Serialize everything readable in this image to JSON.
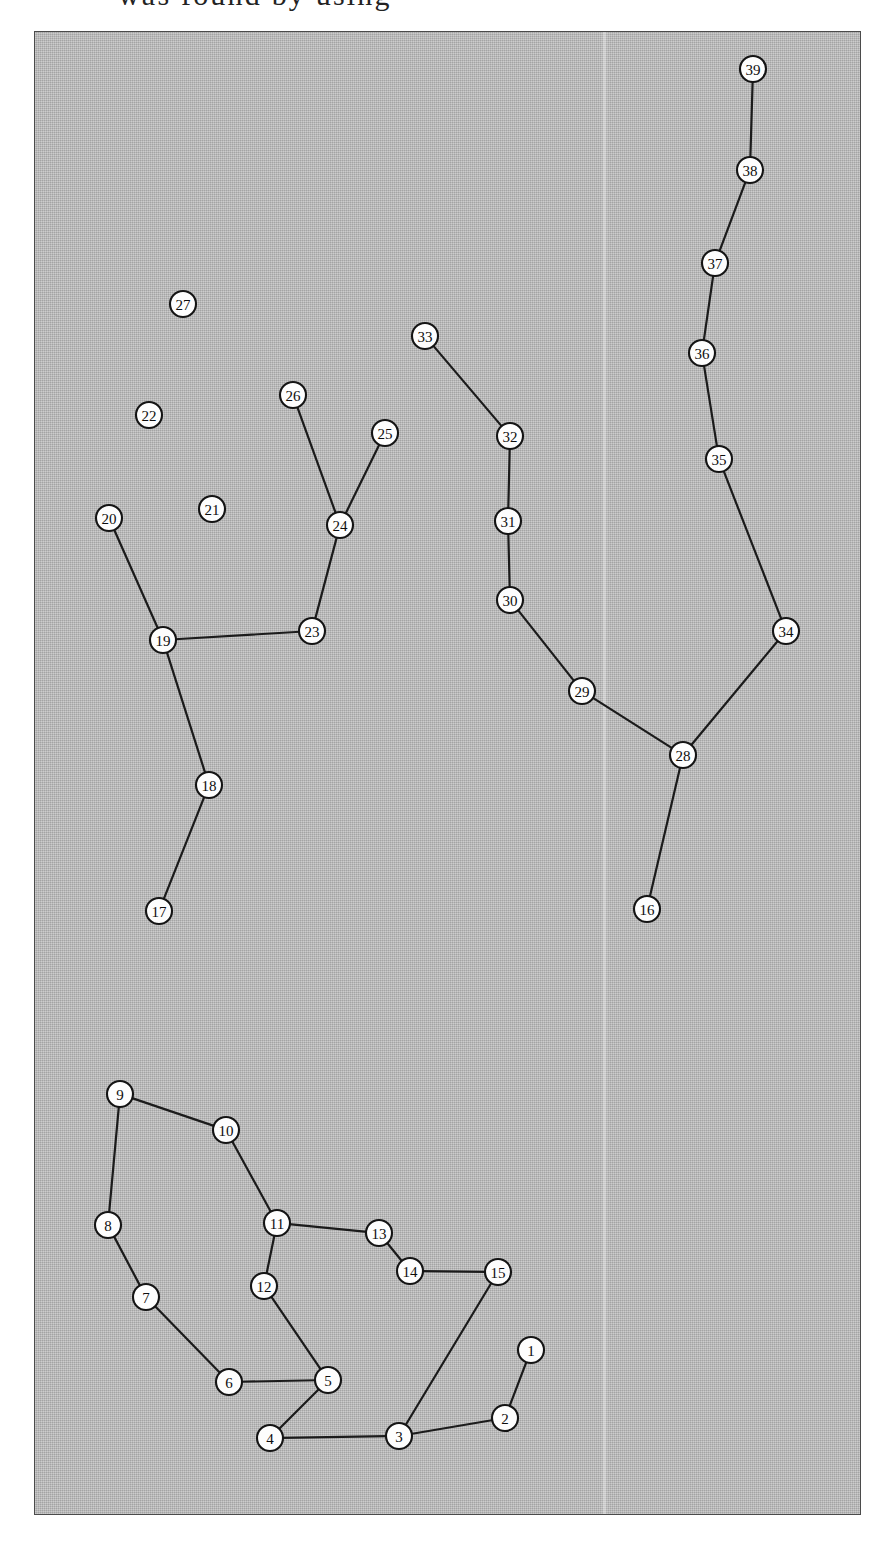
{
  "page": {
    "background_color": "#ffffff",
    "clipped_caption": "was found by using"
  },
  "figure": {
    "frame": {
      "x": 34,
      "y": 31,
      "width": 827,
      "height": 1484
    },
    "background_color": "#b6b6b6",
    "border_color": "#4b4b4b",
    "node_fill": "#fdfdfd",
    "node_stroke": "#141414",
    "edge_color": "#1b1b1b",
    "node_radius": 13
  },
  "chart_data": {
    "type": "diagram",
    "title": "",
    "subtitle": "",
    "xlabel": "",
    "ylabel": "",
    "graph_kind": "undirected node-link graph (forest with isolated vertices)",
    "node_count": 39,
    "edge_count": 35,
    "isolated_nodes": [
      "21",
      "22",
      "27"
    ],
    "nodes": [
      {
        "id": "1",
        "label": "1",
        "x": 496,
        "y": 1318
      },
      {
        "id": "2",
        "label": "2",
        "x": 470,
        "y": 1386
      },
      {
        "id": "3",
        "label": "3",
        "x": 364,
        "y": 1404
      },
      {
        "id": "4",
        "label": "4",
        "x": 235,
        "y": 1406
      },
      {
        "id": "5",
        "label": "5",
        "x": 293,
        "y": 1348
      },
      {
        "id": "6",
        "label": "6",
        "x": 194,
        "y": 1350
      },
      {
        "id": "7",
        "label": "7",
        "x": 111,
        "y": 1265
      },
      {
        "id": "8",
        "label": "8",
        "x": 73,
        "y": 1193
      },
      {
        "id": "9",
        "label": "9",
        "x": 85,
        "y": 1062
      },
      {
        "id": "10",
        "label": "10",
        "x": 191,
        "y": 1098
      },
      {
        "id": "11",
        "label": "11",
        "x": 242,
        "y": 1191
      },
      {
        "id": "12",
        "label": "12",
        "x": 229,
        "y": 1254
      },
      {
        "id": "13",
        "label": "13",
        "x": 344,
        "y": 1201
      },
      {
        "id": "14",
        "label": "14",
        "x": 375,
        "y": 1239
      },
      {
        "id": "15",
        "label": "15",
        "x": 463,
        "y": 1240
      },
      {
        "id": "16",
        "label": "16",
        "x": 612,
        "y": 877
      },
      {
        "id": "17",
        "label": "17",
        "x": 124,
        "y": 879
      },
      {
        "id": "18",
        "label": "18",
        "x": 174,
        "y": 753
      },
      {
        "id": "19",
        "label": "19",
        "x": 128,
        "y": 608
      },
      {
        "id": "20",
        "label": "20",
        "x": 74,
        "y": 486
      },
      {
        "id": "21",
        "label": "21",
        "x": 177,
        "y": 477
      },
      {
        "id": "22",
        "label": "22",
        "x": 114,
        "y": 383
      },
      {
        "id": "27",
        "label": "27",
        "x": 148,
        "y": 272
      },
      {
        "id": "23",
        "label": "23",
        "x": 277,
        "y": 599
      },
      {
        "id": "24",
        "label": "24",
        "x": 305,
        "y": 493
      },
      {
        "id": "25",
        "label": "25",
        "x": 350,
        "y": 401
      },
      {
        "id": "26",
        "label": "26",
        "x": 258,
        "y": 363
      },
      {
        "id": "28",
        "label": "28",
        "x": 648,
        "y": 723
      },
      {
        "id": "29",
        "label": "29",
        "x": 547,
        "y": 659
      },
      {
        "id": "30",
        "label": "30",
        "x": 475,
        "y": 568
      },
      {
        "id": "31",
        "label": "31",
        "x": 473,
        "y": 489
      },
      {
        "id": "32",
        "label": "32",
        "x": 475,
        "y": 404
      },
      {
        "id": "33",
        "label": "33",
        "x": 390,
        "y": 304
      },
      {
        "id": "34",
        "label": "34",
        "x": 751,
        "y": 599
      },
      {
        "id": "35",
        "label": "35",
        "x": 684,
        "y": 427
      },
      {
        "id": "36",
        "label": "36",
        "x": 667,
        "y": 321
      },
      {
        "id": "37",
        "label": "37",
        "x": 680,
        "y": 231
      },
      {
        "id": "38",
        "label": "38",
        "x": 715,
        "y": 138
      },
      {
        "id": "39",
        "label": "39",
        "x": 718,
        "y": 37
      }
    ],
    "edges": [
      {
        "source": "1",
        "target": "2"
      },
      {
        "source": "2",
        "target": "3"
      },
      {
        "source": "3",
        "target": "4"
      },
      {
        "source": "3",
        "target": "15"
      },
      {
        "source": "4",
        "target": "5"
      },
      {
        "source": "5",
        "target": "6"
      },
      {
        "source": "5",
        "target": "12"
      },
      {
        "source": "6",
        "target": "7"
      },
      {
        "source": "7",
        "target": "8"
      },
      {
        "source": "8",
        "target": "9"
      },
      {
        "source": "9",
        "target": "10"
      },
      {
        "source": "10",
        "target": "11"
      },
      {
        "source": "11",
        "target": "12"
      },
      {
        "source": "11",
        "target": "13"
      },
      {
        "source": "13",
        "target": "14"
      },
      {
        "source": "14",
        "target": "15"
      },
      {
        "source": "16",
        "target": "28"
      },
      {
        "source": "17",
        "target": "18"
      },
      {
        "source": "18",
        "target": "19"
      },
      {
        "source": "19",
        "target": "20"
      },
      {
        "source": "19",
        "target": "23"
      },
      {
        "source": "23",
        "target": "24"
      },
      {
        "source": "24",
        "target": "25"
      },
      {
        "source": "24",
        "target": "26"
      },
      {
        "source": "28",
        "target": "29"
      },
      {
        "source": "28",
        "target": "34"
      },
      {
        "source": "29",
        "target": "30"
      },
      {
        "source": "30",
        "target": "31"
      },
      {
        "source": "31",
        "target": "32"
      },
      {
        "source": "32",
        "target": "33"
      },
      {
        "source": "34",
        "target": "35"
      },
      {
        "source": "35",
        "target": "36"
      },
      {
        "source": "36",
        "target": "37"
      },
      {
        "source": "37",
        "target": "38"
      },
      {
        "source": "38",
        "target": "39"
      }
    ]
  }
}
